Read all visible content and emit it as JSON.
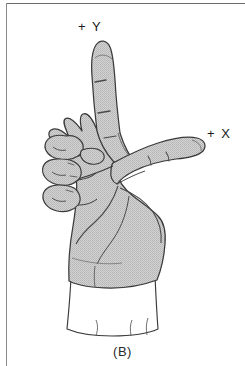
{
  "figure": {
    "caption": "(B)",
    "labels": {
      "y_axis": "+ Y",
      "x_axis": "+ X"
    },
    "colors": {
      "skin_fill": "#c9c9c9",
      "outline": "#3a3a3a",
      "cuff_fill": "#ffffff",
      "frame_rule": "#6b6b6b",
      "text": "#1a1a1a",
      "background": "#ffffff"
    },
    "parts": {
      "index_finger": "index-finger-pointing-up",
      "thumb": "thumb-pointing-right",
      "curled_fingers": "middle-ring-little-fingers-curled",
      "wrist": "wrist",
      "cuff": "shirt-cuff"
    }
  }
}
